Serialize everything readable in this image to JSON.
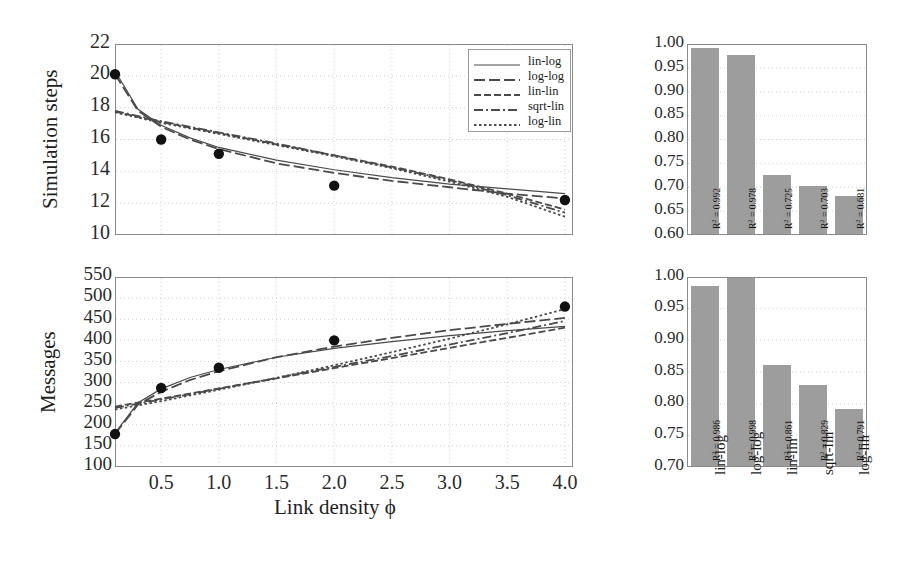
{
  "figure": {
    "panels": [
      "simulation-steps-curves",
      "simulation-steps-r2",
      "messages-curves",
      "messages-r2"
    ]
  },
  "chart_data": [
    {
      "id": "simulation-steps-curves",
      "type": "line",
      "title": "",
      "xlabel": "Link density ϕ",
      "ylabel": "Simulation steps",
      "xlim": [
        0.1,
        4.07
      ],
      "ylim": [
        10,
        22
      ],
      "xticks": [
        "0.5",
        "1.0",
        "1.5",
        "2.0",
        "2.5",
        "3.0",
        "3.5",
        "4.0"
      ],
      "xtickvals": [
        0.5,
        1.0,
        1.5,
        2.0,
        2.5,
        3.0,
        3.5,
        4.0
      ],
      "yticks": [
        "10",
        "12",
        "14",
        "16",
        "18",
        "20",
        "22"
      ],
      "ytickvals": [
        10,
        12,
        14,
        16,
        18,
        20,
        22
      ],
      "grid": true,
      "legend_position": "top-right",
      "points": {
        "name": "measured",
        "x": [
          0.1,
          0.5,
          1.0,
          2.0,
          4.0
        ],
        "y": [
          20.1,
          16.0,
          15.1,
          13.1,
          12.2
        ]
      },
      "series": [
        {
          "name": "lin-log",
          "style": "solid",
          "x": [
            0.1,
            0.3,
            0.5,
            0.75,
            1.0,
            1.5,
            2.0,
            2.5,
            3.0,
            3.5,
            4.0
          ],
          "y": [
            20.3,
            17.9,
            16.9,
            16.1,
            15.5,
            14.7,
            14.1,
            13.6,
            13.2,
            12.9,
            12.6
          ]
        },
        {
          "name": "log-log",
          "style": "longdash",
          "x": [
            0.1,
            0.3,
            0.5,
            0.75,
            1.0,
            1.5,
            2.0,
            2.5,
            3.0,
            3.5,
            4.0
          ],
          "y": [
            20.1,
            17.8,
            16.8,
            16.0,
            15.4,
            14.5,
            13.9,
            13.4,
            13.0,
            12.6,
            12.3
          ]
        },
        {
          "name": "lin-lin",
          "style": "dash",
          "x": [
            0.1,
            0.5,
            1.0,
            1.5,
            2.0,
            2.5,
            3.0,
            3.5,
            4.0
          ],
          "y": [
            17.75,
            17.1,
            16.4,
            15.7,
            15.0,
            14.3,
            13.5,
            12.6,
            11.6
          ]
        },
        {
          "name": "sqrt-lin",
          "style": "dashdot",
          "x": [
            0.1,
            0.5,
            1.0,
            1.5,
            2.0,
            2.5,
            3.0,
            3.5,
            4.0
          ],
          "y": [
            17.8,
            17.15,
            16.45,
            15.75,
            15.0,
            14.25,
            13.45,
            12.5,
            11.4
          ]
        },
        {
          "name": "log-lin",
          "style": "dotted",
          "x": [
            0.1,
            0.5,
            1.0,
            1.5,
            2.0,
            2.5,
            3.0,
            3.5,
            4.0
          ],
          "y": [
            17.7,
            17.05,
            16.35,
            15.65,
            14.95,
            14.2,
            13.35,
            12.4,
            11.15
          ]
        }
      ]
    },
    {
      "id": "simulation-steps-r2",
      "type": "bar",
      "title": "",
      "xlabel": "",
      "ylabel": "",
      "categories": [
        "lin-log",
        "log-log",
        "lin-lin",
        "sqrt-lin",
        "log-lin"
      ],
      "values": [
        0.992,
        0.978,
        0.725,
        0.703,
        0.681
      ],
      "bar_labels": [
        "R² = 0.992",
        "R² = 0.978",
        "R² = 0.725",
        "R² = 0.703",
        "R² = 0.681"
      ],
      "ylim": [
        0.6,
        1.0
      ],
      "yticks": [
        "1.00",
        "0.95",
        "0.90",
        "0.85",
        "0.80",
        "0.75",
        "0.70",
        "0.65",
        "0.60"
      ],
      "ytickvals": [
        1.0,
        0.95,
        0.9,
        0.85,
        0.8,
        0.75,
        0.7,
        0.65,
        0.6
      ],
      "grid": true,
      "bar_color": "#9d9d9d"
    },
    {
      "id": "messages-curves",
      "type": "line",
      "title": "",
      "xlabel": "Link density ϕ",
      "ylabel": "Messages",
      "xlim": [
        0.1,
        4.07
      ],
      "ylim": [
        100,
        550
      ],
      "xticks": [
        "0.5",
        "1.0",
        "1.5",
        "2.0",
        "2.5",
        "3.0",
        "3.5",
        "4.0"
      ],
      "xtickvals": [
        0.5,
        1.0,
        1.5,
        2.0,
        2.5,
        3.0,
        3.5,
        4.0
      ],
      "yticks": [
        "100",
        "150",
        "200",
        "250",
        "300",
        "350",
        "400",
        "450",
        "500",
        "550"
      ],
      "ytickvals": [
        100,
        150,
        200,
        250,
        300,
        350,
        400,
        450,
        500,
        550
      ],
      "grid": true,
      "legend_position": "none",
      "points": {
        "name": "measured",
        "x": [
          0.1,
          0.5,
          1.0,
          2.0,
          4.0
        ],
        "y": [
          178,
          287,
          335,
          400,
          480
        ]
      },
      "series": [
        {
          "name": "lin-log",
          "style": "solid",
          "x": [
            0.1,
            0.3,
            0.5,
            0.75,
            1.0,
            1.5,
            2.0,
            2.5,
            3.0,
            3.5,
            4.0
          ],
          "y": [
            180,
            252,
            285,
            312,
            331,
            360,
            381,
            397,
            411,
            423,
            433
          ]
        },
        {
          "name": "log-log",
          "style": "longdash",
          "x": [
            0.1,
            0.3,
            0.5,
            0.75,
            1.0,
            1.5,
            2.0,
            2.5,
            3.0,
            3.5,
            4.0
          ],
          "y": [
            178,
            248,
            278,
            306,
            327,
            360,
            385,
            406,
            424,
            439,
            453
          ]
        },
        {
          "name": "lin-lin",
          "style": "dash",
          "x": [
            0.1,
            0.5,
            1.0,
            1.5,
            2.0,
            2.5,
            3.0,
            3.5,
            4.0
          ],
          "y": [
            243,
            262,
            286,
            310,
            334,
            358,
            382,
            406,
            430
          ]
        },
        {
          "name": "sqrt-lin",
          "style": "dashdot",
          "x": [
            0.1,
            0.5,
            1.0,
            1.5,
            2.0,
            2.5,
            3.0,
            3.5,
            4.0
          ],
          "y": [
            240,
            260,
            285,
            311,
            337,
            363,
            390,
            417,
            446
          ]
        },
        {
          "name": "log-lin",
          "style": "dotted",
          "x": [
            0.1,
            0.5,
            1.0,
            1.5,
            2.0,
            2.5,
            3.0,
            3.5,
            4.0
          ],
          "y": [
            236,
            256,
            283,
            311,
            341,
            372,
            404,
            438,
            474
          ]
        }
      ]
    },
    {
      "id": "messages-r2",
      "type": "bar",
      "title": "",
      "xlabel": "",
      "ylabel": "",
      "categories": [
        "lin-log",
        "log-log",
        "lin-lin",
        "sqrt-lin",
        "log-lin"
      ],
      "values": [
        0.986,
        0.998,
        0.861,
        0.829,
        0.791
      ],
      "bar_labels": [
        "R² = 0.986",
        "R² = 0.998",
        "R² = 0.861",
        "R² = 0.829",
        "R² = 0.791"
      ],
      "ylim": [
        0.7,
        1.0
      ],
      "yticks": [
        "1.00",
        "0.95",
        "0.90",
        "0.85",
        "0.80",
        "0.75",
        "0.70"
      ],
      "ytickvals": [
        1.0,
        0.95,
        0.9,
        0.85,
        0.8,
        0.75,
        0.7
      ],
      "grid": true,
      "bar_color": "#9d9d9d"
    }
  ],
  "legend": {
    "entries": [
      {
        "label": "lin-log",
        "style": "solid"
      },
      {
        "label": "log-log",
        "style": "longdash"
      },
      {
        "label": "lin-lin",
        "style": "dash"
      },
      {
        "label": "sqrt-lin",
        "style": "dashdot"
      },
      {
        "label": "log-lin",
        "style": "dotted"
      }
    ]
  },
  "labels": {
    "xaxis_shared": "Link density ϕ",
    "yaxis_top": "Simulation steps",
    "yaxis_bottom": "Messages"
  },
  "colors": {
    "line": "#4a4a4a",
    "marker": "#111111",
    "bar": "#9d9d9d",
    "frame": "#8a8a8a",
    "grid": "#cccccc",
    "text": "#1a1a1a"
  }
}
